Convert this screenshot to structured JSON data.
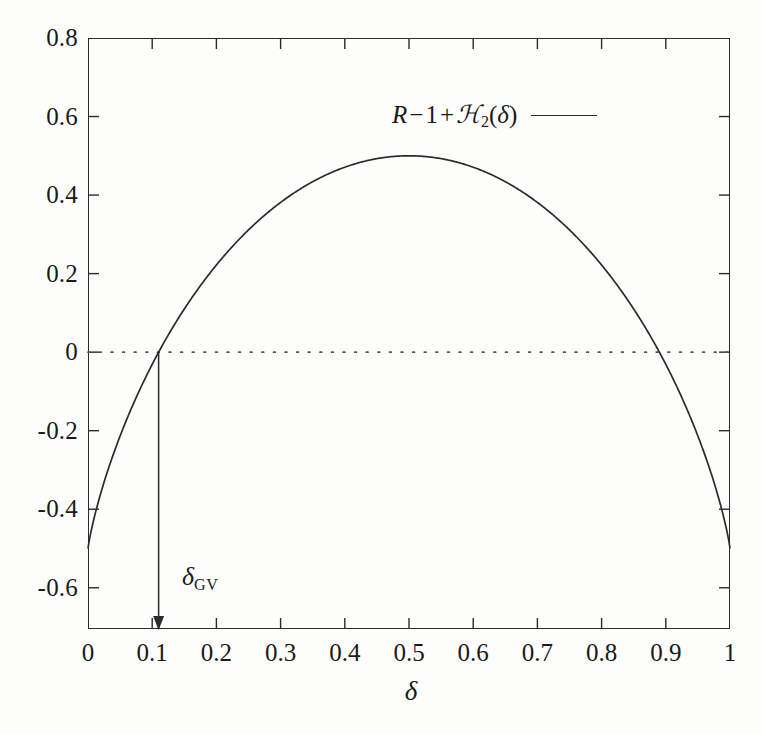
{
  "figure": {
    "background_color": "#fdfdfc",
    "ink_color": "#2b2b2b"
  },
  "legend": {
    "position": "inside-top-center",
    "entry_parts": {
      "r": "R",
      "minus": "−",
      "one": "1",
      "plus": "+",
      "entropy": "ℋ",
      "base": "2",
      "arg_open": "(",
      "arg": "δ",
      "arg_close": ")"
    },
    "entry_plain": "R − 1 + ℋ₂(δ)",
    "sample_style": "solid-line"
  },
  "annotation": {
    "gv_label_parts": {
      "symbol": "δ",
      "sub": "GV"
    },
    "gv_label_plain": "δ_GV",
    "gv_value": 0.11,
    "arrow_from_y": 0,
    "arrow_to_y": -0.705,
    "arrow_direction": "down"
  },
  "chart_data": {
    "type": "line",
    "title": "",
    "subtitle": "",
    "xlabel": "δ",
    "ylabel": "",
    "xlim": [
      0,
      1
    ],
    "ylim": [
      -0.705,
      0.8
    ],
    "grid": false,
    "legend_position": "top-center-inside",
    "xticks": [
      0,
      0.1,
      0.2,
      0.3,
      0.4,
      0.5,
      0.6,
      0.7,
      0.8,
      0.9,
      1
    ],
    "xtick_labels": [
      "0",
      "0.1",
      "0.2",
      "0.3",
      "0.4",
      "0.5",
      "0.6",
      "0.7",
      "0.8",
      "0.9",
      "1"
    ],
    "yticks": [
      0.8,
      0.6,
      0.4,
      0.2,
      0,
      -0.2,
      -0.4,
      -0.6
    ],
    "ytick_labels": [
      "0.8",
      "0.6",
      "0.4",
      "0.2",
      "0",
      "-0.2",
      "-0.4",
      "-0.6"
    ],
    "series": [
      {
        "name": "R − 1 + ℋ₂(δ)",
        "formula": "R - 1 + H2(delta), R = 0.5",
        "rate_R": 0.5,
        "style": "solid",
        "color": "#2b2b2b",
        "x": [
          0,
          0.01,
          0.02,
          0.03,
          0.04,
          0.05,
          0.06,
          0.08,
          0.1,
          0.11,
          0.12,
          0.15,
          0.2,
          0.25,
          0.3,
          0.35,
          0.4,
          0.45,
          0.5,
          0.55,
          0.6,
          0.65,
          0.7,
          0.75,
          0.8,
          0.85,
          0.88,
          0.89,
          0.9,
          0.92,
          0.94,
          0.95,
          0.96,
          0.97,
          0.98,
          0.99,
          1
        ],
        "y": [
          -0.5,
          -0.4192,
          -0.3586,
          -0.3056,
          -0.2578,
          -0.2138,
          -0.1727,
          -0.0978,
          -0.031,
          0.0002,
          0.0294,
          0.1097,
          0.2219,
          0.3113,
          0.382,
          0.4341,
          0.471,
          0.4928,
          0.5,
          0.4928,
          0.471,
          0.4341,
          0.382,
          0.3113,
          0.2219,
          0.1097,
          0.0294,
          0.0002,
          -0.031,
          -0.0978,
          -0.1727,
          -0.2138,
          -0.2578,
          -0.3056,
          -0.3586,
          -0.4192,
          -0.5
        ]
      }
    ],
    "reference_lines": [
      {
        "name": "zero-line",
        "orientation": "horizontal",
        "value": 0,
        "style": "dotted",
        "color": "#555555"
      }
    ],
    "key_points": [
      {
        "label": "maximum",
        "x": 0.5,
        "y": 0.5
      },
      {
        "label": "left-zero-crossing (delta_GV)",
        "x": 0.11,
        "y": 0
      },
      {
        "label": "right-zero-crossing",
        "x": 0.89,
        "y": 0
      },
      {
        "label": "left-endpoint",
        "x": 0,
        "y": -0.5
      },
      {
        "label": "right-endpoint",
        "x": 1,
        "y": -0.5
      }
    ]
  }
}
